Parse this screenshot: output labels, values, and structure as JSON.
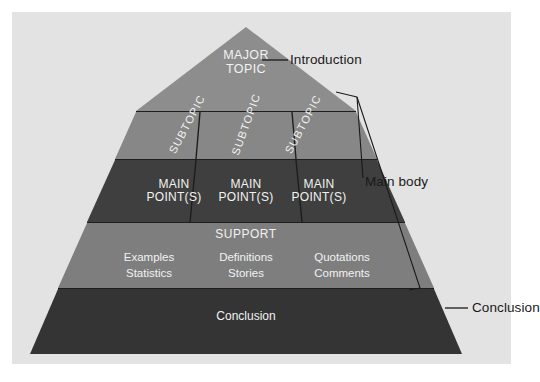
{
  "diagram": {
    "colors": {
      "panel_bg": "#e3e3e3",
      "tier_introduction": "#8d8d8d",
      "tier_subtopic": "#878787",
      "tier_main_point": "#3f3f3f",
      "tier_support": "#7e7e7e",
      "tier_conclusion": "#343434",
      "divider": "#1e1e1e",
      "text_light": "#f2f2f2",
      "text_dark": "#1a1a1a"
    },
    "tiers": [
      {
        "id": "introduction",
        "label": "MAJOR TOPIC",
        "line1": "MAJOR",
        "line2": "TOPIC"
      },
      {
        "id": "subtopics",
        "cells": [
          "SUBTOPIC",
          "SUBTOPIC",
          "SUBTOPIC"
        ]
      },
      {
        "id": "main-points",
        "cells": [
          {
            "line1": "MAIN",
            "line2": "POINT(S)"
          },
          {
            "line1": "MAIN",
            "line2": "POINT(S)"
          },
          {
            "line1": "MAIN",
            "line2": "POINT(S)"
          }
        ]
      },
      {
        "id": "support",
        "heading": "SUPPORT",
        "cells": [
          {
            "line1": "Examples",
            "line2": "Statistics"
          },
          {
            "line1": "Definitions",
            "line2": "Stories"
          },
          {
            "line1": "Quotations",
            "line2": "Comments"
          }
        ]
      },
      {
        "id": "conclusion",
        "label": "Conclusion"
      }
    ],
    "callouts": [
      {
        "id": "introduction",
        "label": "Introduction"
      },
      {
        "id": "main-body",
        "label": "Main body"
      },
      {
        "id": "conclusion",
        "label": "Conclusion"
      }
    ]
  }
}
